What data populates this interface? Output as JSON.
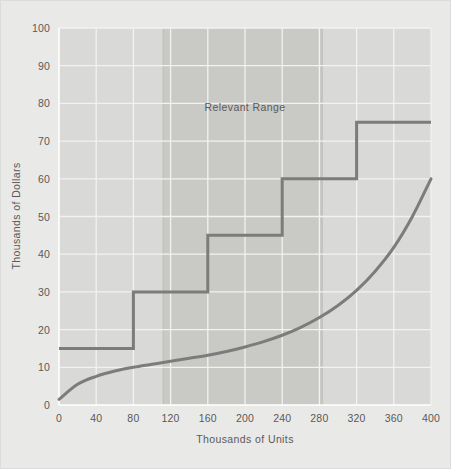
{
  "figure": {
    "background_color": "#e9e9e7",
    "plot_background_color": "#d9d9d7",
    "gridline_color": "#f2f2f0",
    "axis_color": "#ffffff",
    "series_color": "#7c7c7c",
    "band_color": "#c9c9c6",
    "text_color": "#59595a"
  },
  "chart_data": {
    "type": "line",
    "title": "",
    "subtitle": "",
    "xlabel": "Thousands of Units",
    "ylabel": "Thousands of Dollars",
    "xlim": [
      0,
      400
    ],
    "ylim": [
      0,
      100
    ],
    "xticks": [
      0,
      40,
      80,
      120,
      160,
      200,
      240,
      280,
      320,
      360,
      400
    ],
    "xtick_labels": [
      "0",
      "40",
      "80",
      "120",
      "160",
      "200",
      "240",
      "280",
      "320",
      "360",
      "400"
    ],
    "yticks": [
      0,
      10,
      20,
      30,
      40,
      50,
      60,
      70,
      80,
      90,
      100
    ],
    "ytick_labels": [
      "0",
      "10",
      "20",
      "30",
      "40",
      "50",
      "60",
      "70",
      "80",
      "90",
      "100"
    ],
    "grid": true,
    "grid_axis": "both",
    "legend": false,
    "legend_position": "none",
    "series": [
      {
        "name": "Step Fixed Cost",
        "type": "step",
        "style": "post",
        "color": "#7c7c7c",
        "linewidth": 3,
        "steps": [
          {
            "x_start": 0,
            "x_end": 80,
            "y": 15
          },
          {
            "x_start": 80,
            "x_end": 160,
            "y": 30
          },
          {
            "x_start": 160,
            "x_end": 240,
            "y": 45
          },
          {
            "x_start": 240,
            "x_end": 320,
            "y": 60
          },
          {
            "x_start": 320,
            "x_end": 400,
            "y": 75
          }
        ],
        "points": [
          {
            "x": 0,
            "y": 15
          },
          {
            "x": 80,
            "y": 15
          },
          {
            "x": 80,
            "y": 30
          },
          {
            "x": 160,
            "y": 30
          },
          {
            "x": 160,
            "y": 45
          },
          {
            "x": 240,
            "y": 45
          },
          {
            "x": 240,
            "y": 60
          },
          {
            "x": 320,
            "y": 60
          },
          {
            "x": 320,
            "y": 75
          },
          {
            "x": 400,
            "y": 75
          }
        ]
      },
      {
        "name": "Variable Cost Curve",
        "type": "curve",
        "color": "#7c7c7c",
        "linewidth": 3,
        "points": [
          {
            "x": 0,
            "y": 1.5
          },
          {
            "x": 20,
            "y": 5.5
          },
          {
            "x": 40,
            "y": 7.6
          },
          {
            "x": 60,
            "y": 9.0
          },
          {
            "x": 80,
            "y": 10.0
          },
          {
            "x": 100,
            "y": 10.8
          },
          {
            "x": 120,
            "y": 11.6
          },
          {
            "x": 140,
            "y": 12.4
          },
          {
            "x": 160,
            "y": 13.2
          },
          {
            "x": 180,
            "y": 14.2
          },
          {
            "x": 200,
            "y": 15.4
          },
          {
            "x": 220,
            "y": 16.8
          },
          {
            "x": 240,
            "y": 18.5
          },
          {
            "x": 260,
            "y": 20.6
          },
          {
            "x": 280,
            "y": 23.2
          },
          {
            "x": 300,
            "y": 26.4
          },
          {
            "x": 320,
            "y": 30.4
          },
          {
            "x": 340,
            "y": 35.5
          },
          {
            "x": 360,
            "y": 41.8
          },
          {
            "x": 380,
            "y": 50.0
          },
          {
            "x": 400,
            "y": 60.0
          }
        ]
      }
    ],
    "annotations": [
      {
        "name": "relevant-range-label",
        "text": "Relevant Range",
        "x": 200,
        "y": 78
      }
    ],
    "shaded_bands": [
      {
        "name": "relevant-range-band",
        "orientation": "vertical",
        "x_start": 112,
        "x_end": 283,
        "color": "#c9c9c6",
        "label": "Relevant Range"
      }
    ]
  }
}
